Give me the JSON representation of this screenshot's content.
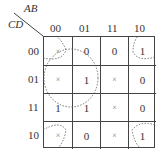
{
  "kmap": {
    "row_var": "CD",
    "col_var": "AB",
    "col_labels": [
      "00",
      "01",
      "11",
      "10"
    ],
    "row_labels": [
      "00",
      "01",
      "11",
      "10"
    ],
    "cells": [
      [
        "×",
        "0",
        "0",
        "1"
      ],
      [
        "×",
        "1",
        "×",
        "0"
      ],
      [
        "1",
        "1",
        "×",
        "0"
      ],
      [
        "×",
        "0",
        "×",
        "1"
      ]
    ]
  }
}
